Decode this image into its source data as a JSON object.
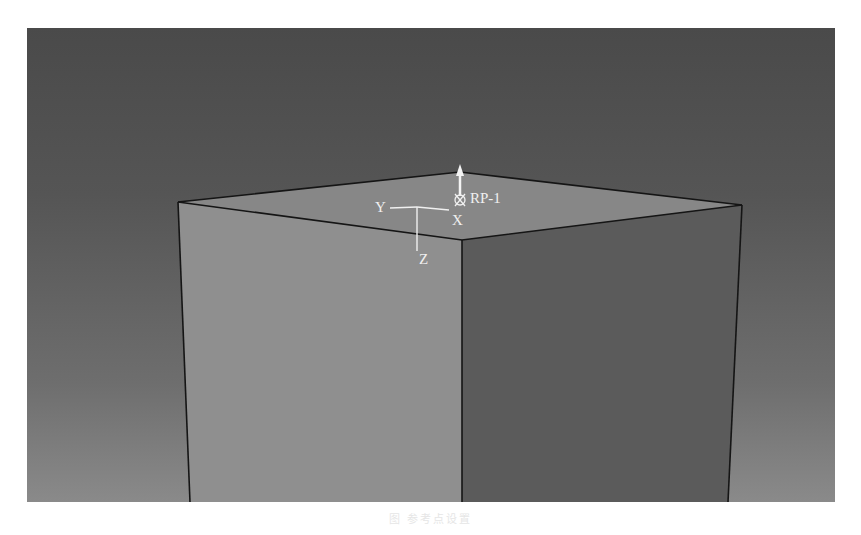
{
  "viewport": {
    "name": "3D model viewport",
    "background_top": "#4a4a4a",
    "background_bottom": "#8a8a8a"
  },
  "model": {
    "shape": "rectangular block (cube top view, isometric)",
    "face_colors": {
      "top": "#868686",
      "left": "#8f8f8f",
      "right": "#5a5a5a"
    },
    "edge_color": "#111111"
  },
  "triad": {
    "x_label": "X",
    "y_label": "Y",
    "z_label": "Z",
    "color": "#f2f2f2"
  },
  "reference_point": {
    "label": "RP-1",
    "color": "#f2f2f2"
  },
  "caption": {
    "text": "图 参考点设置"
  }
}
